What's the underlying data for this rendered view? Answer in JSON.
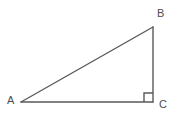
{
  "figure": {
    "kind": "right-triangle-diagram",
    "background_color": "#ffffff",
    "stroke_color": "#595959",
    "label_color": "#4d4d4d",
    "stroke_width": 1.4,
    "labels": {
      "a": "A",
      "b": "B",
      "c": "C"
    },
    "vertices": {
      "a": {
        "x": 21,
        "y": 102
      },
      "b": {
        "x": 153,
        "y": 27
      },
      "c": {
        "x": 153,
        "y": 102
      }
    },
    "sides": [
      {
        "name": "hypotenuse-AB",
        "from": "a",
        "to": "b"
      },
      {
        "name": "leg-BC",
        "from": "b",
        "to": "c"
      },
      {
        "name": "leg-AC",
        "from": "a",
        "to": "c"
      }
    ],
    "right_angle_marker": {
      "at_vertex": "c",
      "size": 9,
      "x": 144,
      "y": 93
    }
  }
}
